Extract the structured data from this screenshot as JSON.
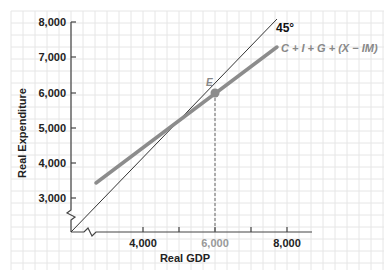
{
  "chart_data": {
    "type": "line",
    "title": "",
    "xlabel": "Real GDP",
    "ylabel": "Real Expenditure",
    "xlim": [
      2000,
      8500
    ],
    "ylim": [
      2000,
      8000
    ],
    "x_ticks": [
      {
        "value": 4000,
        "label": "4,000"
      },
      {
        "value": 5000,
        "label": ""
      },
      {
        "value": 6000,
        "label": "6,000"
      },
      {
        "value": 7000,
        "label": ""
      },
      {
        "value": 8000,
        "label": "8,000"
      }
    ],
    "y_ticks": [
      {
        "value": 3000,
        "label": "3,000"
      },
      {
        "value": 4000,
        "label": "4,000"
      },
      {
        "value": 5000,
        "label": "5,000"
      },
      {
        "value": 6000,
        "label": "6,000"
      },
      {
        "value": 7000,
        "label": "7,000"
      },
      {
        "value": 8000,
        "label": "8,000"
      }
    ],
    "grid": true,
    "axis_breaks": [
      "x",
      "y"
    ],
    "series": [
      {
        "name": "45°",
        "x": [
          2000,
          8000
        ],
        "y": [
          2000,
          8000
        ],
        "color": "#333333",
        "width": 1
      },
      {
        "name": "C + I + G + (X − IM)",
        "x": [
          2700,
          7700
        ],
        "y": [
          3450,
          7300
        ],
        "color": "#8c8c8c",
        "width": 4
      }
    ],
    "annotations": [
      {
        "label": "E",
        "x": 6000,
        "y": 6000,
        "type": "point",
        "color": "#8c8c8c"
      },
      {
        "type": "dashed-vline",
        "x": 6000,
        "from_y": 2000,
        "to_y": 6000
      }
    ],
    "highlighted_tick": "6,000"
  },
  "labels": {
    "x_axis_title": "Real GDP",
    "y_axis_title": "Real Expenditure",
    "line_45": "45°",
    "line_ae": "C + I + G + (X − IM)",
    "point_e": "E",
    "x_ticks": [
      "4,000",
      "6,000",
      "8,000"
    ],
    "y_ticks": [
      "8,000",
      "7,000",
      "6,000",
      "5,000",
      "4,000",
      "3,000"
    ]
  },
  "colors": {
    "grid": "#e6e6e6",
    "axis": "#444444",
    "ae_line": "#8c8c8c",
    "line_45": "#333333",
    "point": "#8c8c8c",
    "highlight_tick": "#999999"
  }
}
